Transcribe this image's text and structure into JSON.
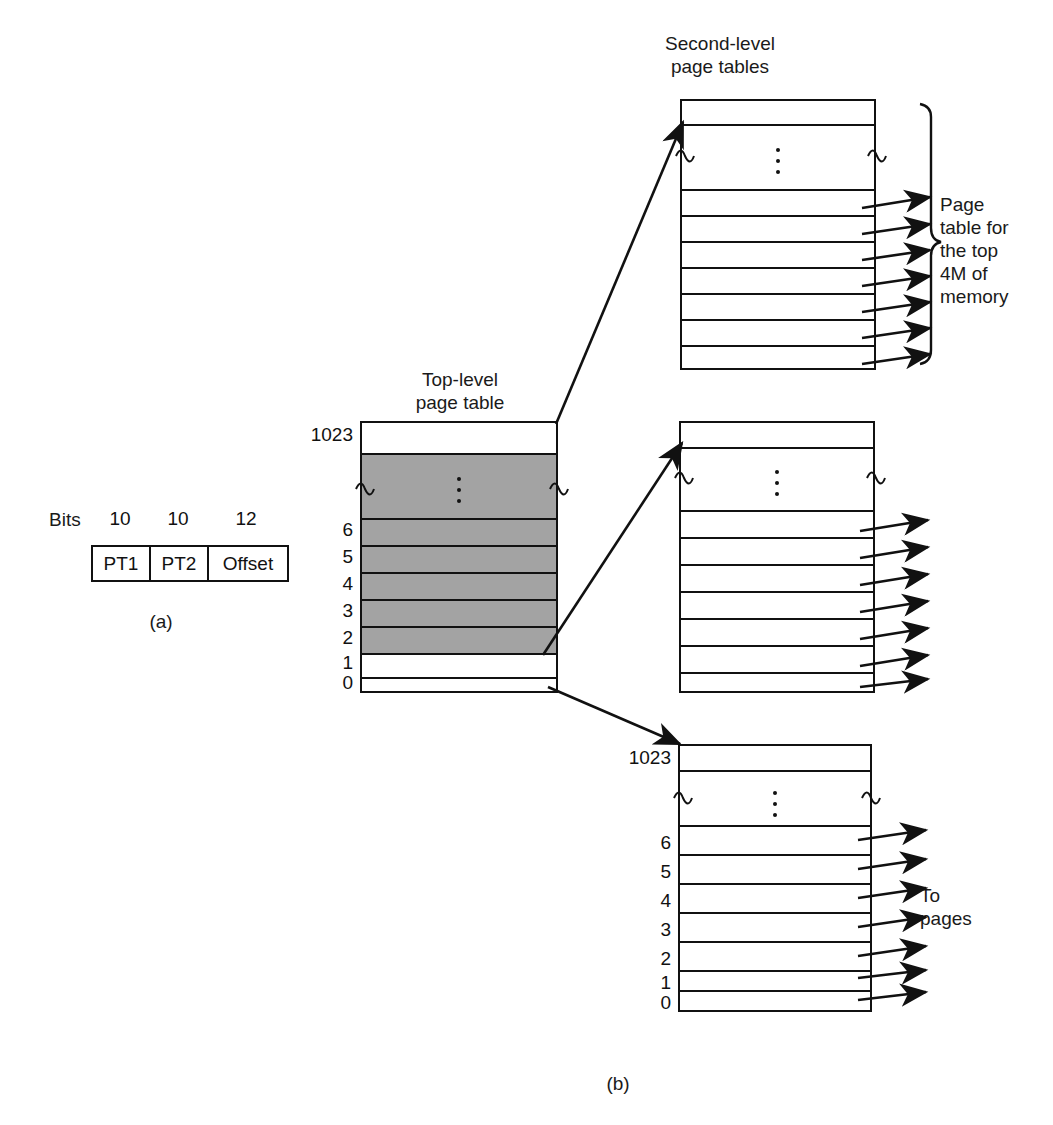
{
  "figure": {
    "caption_a": "(a)",
    "caption_b": "(b)"
  },
  "part_a": {
    "bits_label": "Bits",
    "bit_counts": [
      "10",
      "10",
      "12"
    ],
    "fields": [
      "PT1",
      "PT2",
      "Offset"
    ]
  },
  "part_b": {
    "top_level_title_line1": "Top-level",
    "top_level_title_line2": "page table",
    "second_level_title_line1": "Second-level",
    "second_level_title_line2": "page tables",
    "brace_note": "Page\ntable for\nthe top\n4M of\nmemory",
    "to_pages_line1": "To",
    "to_pages_line2": "pages",
    "top_level_table": {
      "name": "Top-level page table",
      "entries": [
        {
          "label": "1023",
          "fill": "white"
        },
        {
          "label": "",
          "fill": "gray",
          "elided": true
        },
        {
          "label": "6",
          "fill": "gray"
        },
        {
          "label": "5",
          "fill": "gray"
        },
        {
          "label": "4",
          "fill": "gray"
        },
        {
          "label": "3",
          "fill": "gray"
        },
        {
          "label": "2",
          "fill": "gray"
        },
        {
          "label": "1",
          "fill": "white"
        },
        {
          "label": "0",
          "fill": "white"
        }
      ]
    },
    "second_level_tables": [
      {
        "name": "Page table for the top 4M of memory",
        "labels_shown": false,
        "entries": [
          {
            "label": "",
            "fill": "white"
          },
          {
            "label": "",
            "fill": "white",
            "elided": true
          },
          {
            "label": "",
            "fill": "white",
            "arrow": true
          },
          {
            "label": "",
            "fill": "white",
            "arrow": true
          },
          {
            "label": "",
            "fill": "white",
            "arrow": true
          },
          {
            "label": "",
            "fill": "white",
            "arrow": true
          },
          {
            "label": "",
            "fill": "white",
            "arrow": true
          },
          {
            "label": "",
            "fill": "white",
            "arrow": true
          },
          {
            "label": "",
            "fill": "white",
            "arrow": true
          }
        ]
      },
      {
        "name": "Second-level page table (middle)",
        "labels_shown": false,
        "entries": [
          {
            "label": "",
            "fill": "white"
          },
          {
            "label": "",
            "fill": "white",
            "elided": true
          },
          {
            "label": "",
            "fill": "white",
            "arrow": true
          },
          {
            "label": "",
            "fill": "white",
            "arrow": true
          },
          {
            "label": "",
            "fill": "white",
            "arrow": true
          },
          {
            "label": "",
            "fill": "white",
            "arrow": true
          },
          {
            "label": "",
            "fill": "white",
            "arrow": true
          },
          {
            "label": "",
            "fill": "white",
            "arrow": true
          },
          {
            "label": "",
            "fill": "white",
            "arrow": true
          }
        ]
      },
      {
        "name": "Second-level page table (bottom)",
        "labels_shown": true,
        "entries": [
          {
            "label": "1023",
            "fill": "white"
          },
          {
            "label": "",
            "fill": "white",
            "elided": true
          },
          {
            "label": "6",
            "fill": "white",
            "arrow": true
          },
          {
            "label": "5",
            "fill": "white",
            "arrow": true
          },
          {
            "label": "4",
            "fill": "white",
            "arrow": true
          },
          {
            "label": "3",
            "fill": "white",
            "arrow": true
          },
          {
            "label": "2",
            "fill": "white",
            "arrow": true
          },
          {
            "label": "1",
            "fill": "white",
            "arrow": true
          },
          {
            "label": "0",
            "fill": "white",
            "arrow": true
          }
        ]
      }
    ]
  },
  "colors": {
    "ink": "#111111",
    "shaded_entry": "#a3a3a3",
    "background": "#ffffff"
  }
}
